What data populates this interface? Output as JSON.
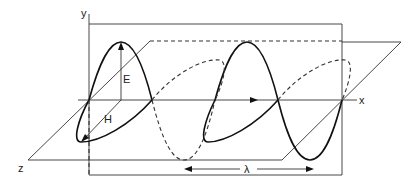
{
  "diagram": {
    "title": "",
    "labels": {
      "y_axis": "y",
      "x_axis": "x",
      "z_axis": "z",
      "electric_field": "E",
      "magnetic_field": "H",
      "wavelength": "λ"
    },
    "colors": {
      "line": "#111111",
      "background": "#ffffff"
    }
  }
}
